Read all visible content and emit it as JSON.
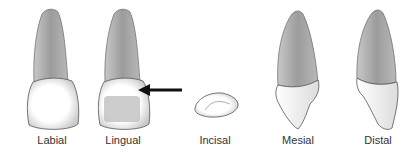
{
  "diagram": {
    "views": [
      {
        "id": "labial",
        "label": "Labial",
        "cx": 52
      },
      {
        "id": "lingual",
        "label": "Lingual",
        "cx": 123
      },
      {
        "id": "incisal",
        "label": "Incisal",
        "cx": 215
      },
      {
        "id": "mesial",
        "label": "Mesial",
        "cx": 298
      },
      {
        "id": "distal",
        "label": "Distal",
        "cx": 378
      }
    ],
    "annotation": {
      "type": "arrow",
      "points_to": "lingual",
      "direction": "left"
    },
    "colors": {
      "root": "#9a9a9a",
      "root_light": "#c4c4c4",
      "crown": "#f8f8f8",
      "outline": "#555555",
      "arrow": "#111111"
    }
  }
}
